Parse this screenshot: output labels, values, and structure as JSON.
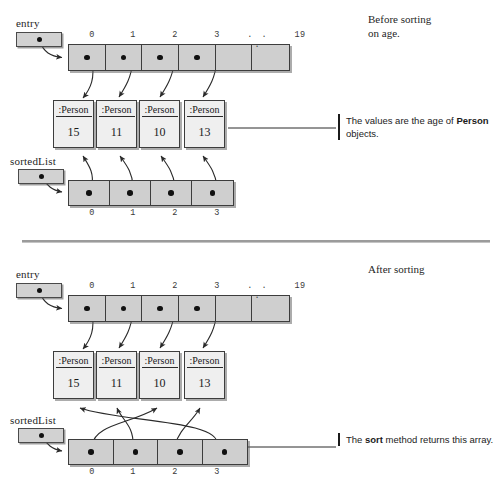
{
  "diagram": {
    "title_top": "Before sorting\non age.",
    "title_bottom": "After sorting",
    "notes": {
      "top_note_line1": "The values are the age of ",
      "top_note_bold": "Person",
      "top_note_line2": " objects.",
      "bottom_note_line1": "The ",
      "bottom_note_bold": "sort",
      "bottom_note_line2": " method returns\nthis array."
    },
    "labels": {
      "entry": "entry",
      "sortedList": "sortedList"
    },
    "person_label": ":Person"
  },
  "before": {
    "entry_array": {
      "indices": [
        "0",
        "1",
        "2",
        "3",
        ". . .",
        "19"
      ],
      "filled": [
        true,
        true,
        true,
        true,
        false,
        false
      ]
    },
    "persons": [
      {
        "name": ":Person",
        "age": "15"
      },
      {
        "name": ":Person",
        "age": "11"
      },
      {
        "name": ":Person",
        "age": "10"
      },
      {
        "name": ":Person",
        "age": "13"
      }
    ],
    "sorted_array": {
      "indices": [
        "0",
        "1",
        "2",
        "3"
      ],
      "filled": [
        true,
        true,
        true,
        true
      ]
    },
    "entry_links": [
      {
        "from_cell": 0,
        "to_person": 0
      },
      {
        "from_cell": 1,
        "to_person": 1
      },
      {
        "from_cell": 2,
        "to_person": 2
      },
      {
        "from_cell": 3,
        "to_person": 3
      }
    ],
    "sorted_links": [
      {
        "from_cell": 0,
        "to_person": 0
      },
      {
        "from_cell": 1,
        "to_person": 1
      },
      {
        "from_cell": 2,
        "to_person": 2
      },
      {
        "from_cell": 3,
        "to_person": 3
      }
    ]
  },
  "after": {
    "entry_array": {
      "indices": [
        "0",
        "1",
        "2",
        "3",
        ". . .",
        "19"
      ],
      "filled": [
        true,
        true,
        true,
        true,
        false,
        false
      ]
    },
    "persons": [
      {
        "name": ":Person",
        "age": "15"
      },
      {
        "name": ":Person",
        "age": "11"
      },
      {
        "name": ":Person",
        "age": "10"
      },
      {
        "name": ":Person",
        "age": "13"
      }
    ],
    "sorted_array": {
      "indices": [
        "0",
        "1",
        "2",
        "3"
      ],
      "filled": [
        true,
        true,
        true,
        true
      ]
    },
    "entry_links": [
      {
        "from_cell": 0,
        "to_person": 0
      },
      {
        "from_cell": 1,
        "to_person": 1
      },
      {
        "from_cell": 2,
        "to_person": 2
      },
      {
        "from_cell": 3,
        "to_person": 3
      }
    ],
    "sorted_links": [
      {
        "from_cell": 0,
        "to_person": 2
      },
      {
        "from_cell": 1,
        "to_person": 1
      },
      {
        "from_cell": 2,
        "to_person": 3
      },
      {
        "from_cell": 3,
        "to_person": 0
      }
    ]
  },
  "colors": {
    "array_fill": "#cfcfcf",
    "person_fill": "#efefef",
    "stroke": "#3d3d3d",
    "divider": "#9b9b9b"
  }
}
